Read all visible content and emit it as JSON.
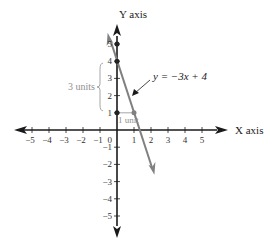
{
  "chart_data": {
    "type": "line",
    "title": "",
    "xlabel": "X axis",
    "ylabel": "Y axis",
    "xlim": [
      -5.5,
      5.5
    ],
    "ylim": [
      -5.5,
      5.5
    ],
    "x_ticks": [
      -5,
      -4,
      -3,
      -2,
      -1,
      1,
      2,
      3,
      4,
      5
    ],
    "y_ticks": [
      -5,
      -4,
      -3,
      -2,
      -1,
      1,
      2,
      3,
      4,
      5
    ],
    "x_tick_labels": [
      "−5",
      "−4",
      "−3",
      "−2",
      "−1",
      "1",
      "2",
      "3",
      "4",
      "5"
    ],
    "y_tick_labels": [
      "−5",
      "−4",
      "−3",
      "−2",
      "−1",
      "1",
      "2",
      "3",
      "4",
      "5"
    ],
    "origin_label": "0",
    "grid": false,
    "series": [
      {
        "name": "y = −3x + 4",
        "slope": -3,
        "intercept": 4,
        "x": [
          -0.55,
          2.2
        ],
        "y": [
          5.65,
          -2.6
        ],
        "color": "#808080"
      }
    ],
    "points": [
      {
        "x": 0,
        "y": 5,
        "color": "#222222"
      },
      {
        "x": 0,
        "y": 4,
        "color": "#222222"
      },
      {
        "x": 0,
        "y": 1,
        "color": "#222222"
      },
      {
        "x": 1,
        "y": 1,
        "color": "#808080"
      }
    ],
    "annotations": [
      {
        "text": "y = −3x + 4",
        "arrow_to": [
          0.85,
          1.5
        ]
      },
      {
        "text": "3 units",
        "type": "brace",
        "from_y": 1,
        "to_y": 4
      },
      {
        "text": "1 unit",
        "type": "segment",
        "from_x": 0,
        "to_x": 1,
        "y": 1
      }
    ]
  },
  "labels": {
    "x_axis": "X axis",
    "y_axis": "Y axis",
    "equation": "y = −3x + 4",
    "rise": "3 units",
    "run": "1 unit",
    "origin": "0"
  },
  "colors": {
    "axis": "#1a1a1a",
    "line": "#808080",
    "annotation": "#909090"
  }
}
